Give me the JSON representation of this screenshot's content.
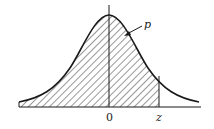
{
  "diagram": {
    "type": "normal-distribution-shaded-area",
    "labels": {
      "area_label": "p",
      "mean_label": "0",
      "z_label": "z"
    },
    "colors": {
      "stroke": "#1a1a1a",
      "hatch": "#333333",
      "background": "#ffffff"
    },
    "shaded_region": "left tail up to z"
  }
}
